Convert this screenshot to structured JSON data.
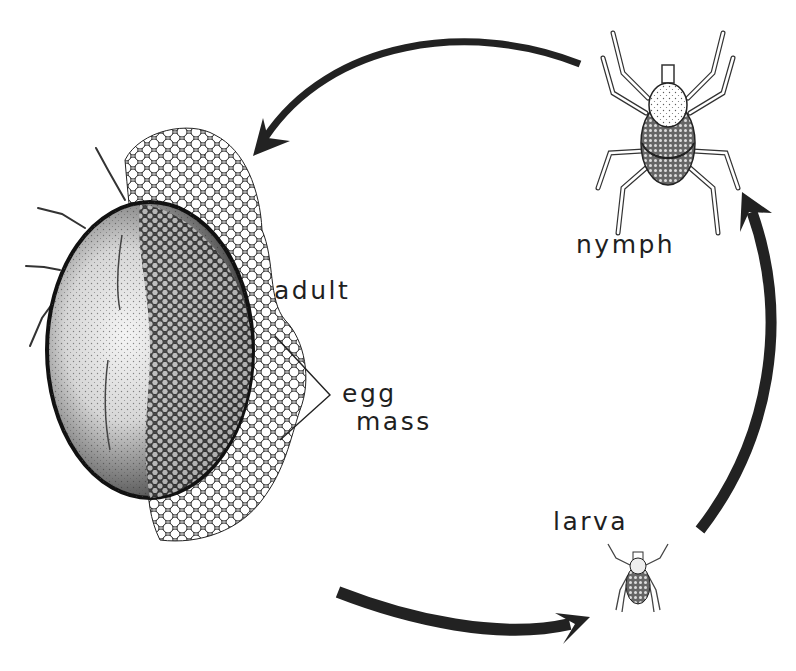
{
  "diagram": {
    "type": "life-cycle",
    "colors": {
      "ink": "#1f1f1f",
      "background": "#ffffff"
    },
    "stages": [
      {
        "id": "adult",
        "label": "adult"
      },
      {
        "id": "egg_mass",
        "label_line1": "egg",
        "label_line2": "mass"
      },
      {
        "id": "larva",
        "label": "larva"
      },
      {
        "id": "nymph",
        "label": "nymph"
      }
    ],
    "arrows": [
      {
        "from": "adult",
        "to": "larva",
        "position": "bottom"
      },
      {
        "from": "larva",
        "to": "nymph",
        "position": "right"
      },
      {
        "from": "nymph",
        "to": "adult",
        "position": "top"
      }
    ]
  }
}
